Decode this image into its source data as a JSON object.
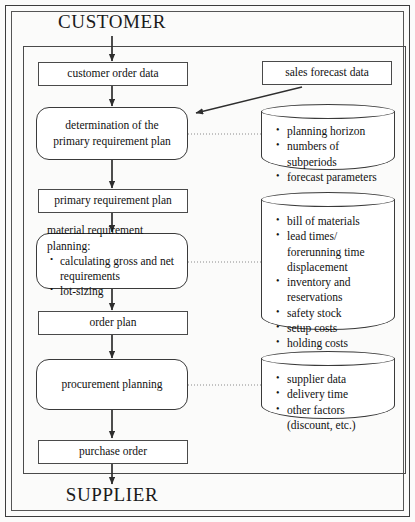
{
  "diagram": {
    "title_top": "CUSTOMER",
    "title_bottom": "SUPPLIER",
    "flow": {
      "customer_order_data": "customer order data",
      "sales_forecast_data": "sales forecast data",
      "determination_line1": "determination of the",
      "determination_line2": "primary requirement plan",
      "primary_requirement_plan": "primary requirement plan",
      "mrp_header": "material requirement planning:",
      "mrp_item1": "calculating gross and net requirements",
      "mrp_item2": "lot-sizing",
      "order_plan": "order plan",
      "procurement_planning": "procurement planning",
      "purchase_order": "purchase order"
    },
    "stores": {
      "forecast_store": {
        "items": [
          "planning horizon",
          "numbers of subperiods",
          "forecast parameters"
        ]
      },
      "material_store": {
        "items": [
          "bill of materials",
          "lead times/ forerunning time displacement",
          "inventory and reservations",
          "safety stock",
          "setup costs",
          "holding costs"
        ],
        "item_lines": [
          [
            "bill of materials"
          ],
          [
            "lead times/",
            "forerunning time",
            "displacement"
          ],
          [
            "inventory and",
            "reservations"
          ],
          [
            "safety stock"
          ],
          [
            "setup costs"
          ],
          [
            "holding costs"
          ]
        ]
      },
      "supplier_store": {
        "items": [
          "supplier data",
          "delivery time",
          "other factors (discount, etc.)"
        ],
        "item_lines": [
          [
            "supplier data"
          ],
          [
            "delivery time"
          ],
          [
            "other factors",
            "(discount, etc.)"
          ]
        ]
      }
    },
    "colors": {
      "line": "#3a3a3a",
      "background": "#fbfbfa",
      "box_fill": "#ffffff",
      "text": "#111111"
    }
  }
}
